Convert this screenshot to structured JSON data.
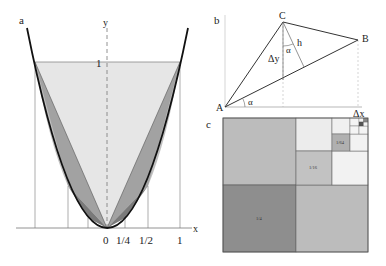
{
  "panel_a": {
    "label": "a",
    "axis_x": "x",
    "axis_y": "y",
    "y_tick": "1",
    "x_ticks": [
      "0",
      "1/4",
      "1/2",
      "1"
    ],
    "colors": {
      "light": "#e6e6e6",
      "mid": "#bdbdbd",
      "dark": "#8c8c8c",
      "curve": "#111111"
    }
  },
  "panel_b": {
    "label": "b",
    "points": {
      "A": "A",
      "B": "B",
      "C": "C"
    },
    "h": "h",
    "delta_y": "Δy",
    "delta_x": "Δx",
    "alpha_1": "α",
    "alpha_2": "α"
  },
  "panel_c": {
    "label": "c",
    "areas": [
      "1/4",
      "1/16",
      "1/64"
    ],
    "colors": {
      "quarter": "#8e8e8e",
      "sixteenth": "#c2c2c2",
      "sixtyfourth": "#b0b0b0",
      "big_light": "#bcbcbc",
      "pale": "#ededed"
    }
  }
}
